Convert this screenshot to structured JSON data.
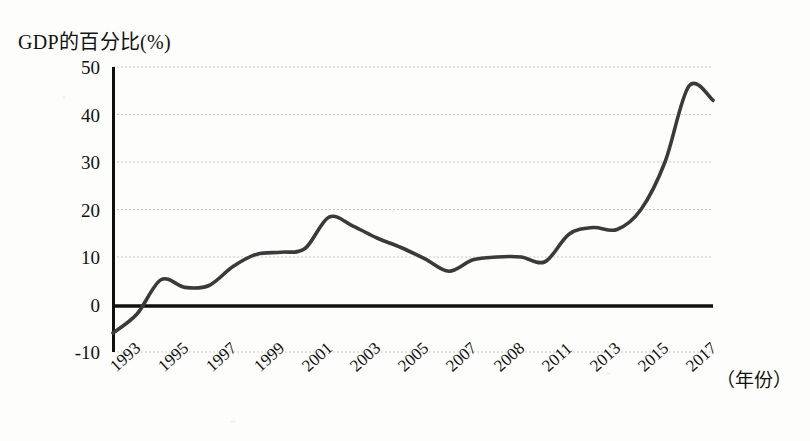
{
  "chart_data": {
    "type": "line",
    "title": "",
    "ylabel": "GDP的百分比(%)",
    "xlabel": "（年份）",
    "ylim": [
      -10,
      50
    ],
    "yticks": [
      50,
      40,
      30,
      20,
      10,
      0,
      -10
    ],
    "ytick_labels": [
      "50",
      "40",
      "30",
      "20",
      "10",
      "0",
      "-10"
    ],
    "xtick_labels": [
      "1993",
      "1995",
      "1997",
      "1999",
      "2001",
      "2003",
      "2005",
      "2007",
      "2008",
      "2011",
      "2013",
      "2015",
      "2017"
    ],
    "grid": true,
    "legend": null,
    "zero_line": true,
    "line_color": "#3a3a3a",
    "grid_color": "#c9c9c9",
    "axis_color": "#101010",
    "x": [
      1993,
      1994,
      1995,
      1996,
      1997,
      1998,
      1999,
      2000,
      2001,
      2002,
      2003,
      2004,
      2005,
      2006,
      2007,
      2008,
      2009,
      2010,
      2011,
      2012,
      2013,
      2014,
      2015,
      2016,
      2017,
      2018
    ],
    "values": [
      -6.0,
      -2.0,
      5.2,
      3.6,
      4.0,
      8.0,
      10.6,
      11.0,
      11.8,
      18.4,
      16.5,
      14.0,
      12.0,
      9.6,
      7.0,
      9.4,
      10.0,
      10.0,
      9.0,
      14.8,
      16.2,
      15.8,
      20.0,
      30.0,
      46.0,
      43.0
    ],
    "series": [
      {
        "name": "GDP的百分比(%)",
        "values": [
          -6.0,
          -2.0,
          5.2,
          3.6,
          4.0,
          8.0,
          10.6,
          11.0,
          11.8,
          18.4,
          16.5,
          14.0,
          12.0,
          9.6,
          7.0,
          9.4,
          10.0,
          10.0,
          9.0,
          14.8,
          16.2,
          15.8,
          20.0,
          30.0,
          46.0,
          43.0
        ]
      }
    ],
    "annotations": []
  }
}
